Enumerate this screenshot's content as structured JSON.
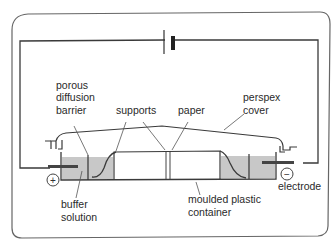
{
  "diagram": {
    "labels": {
      "porous_barrier": [
        "porous",
        "diffusion",
        "barrier"
      ],
      "supports": "supports",
      "paper": "paper",
      "perspex_cover": [
        "perspex",
        "cover"
      ],
      "buffer_solution": [
        "buffer",
        "solution"
      ],
      "moulded_container": [
        "moulded plastic",
        "container"
      ],
      "electrode": "electrode"
    },
    "symbols": {
      "positive": "+",
      "negative": "−"
    },
    "colors": {
      "frame": "#555555",
      "wire": "#333333",
      "buffer_fill": "#c8c8c8",
      "background": "#ffffff"
    }
  }
}
